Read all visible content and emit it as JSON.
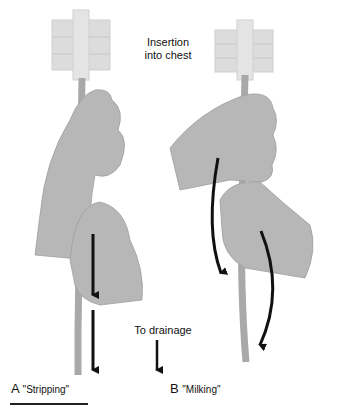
{
  "figure": {
    "labels": {
      "insertion": "Insertion\ninto chest",
      "insertion_line1": "Insertion",
      "insertion_line2": "into chest",
      "drainage": "To drainage"
    },
    "panels": [
      {
        "letter": "A",
        "caption": "\"Stripping\""
      },
      {
        "letter": "B",
        "caption": "\"Milking\""
      }
    ],
    "colors": {
      "hand": "#b7b7b7",
      "hand_outline": "#9a9a9a",
      "dressing": "#dcdcdc",
      "tube": "#a9a9a9",
      "arrow": "#111111"
    }
  }
}
